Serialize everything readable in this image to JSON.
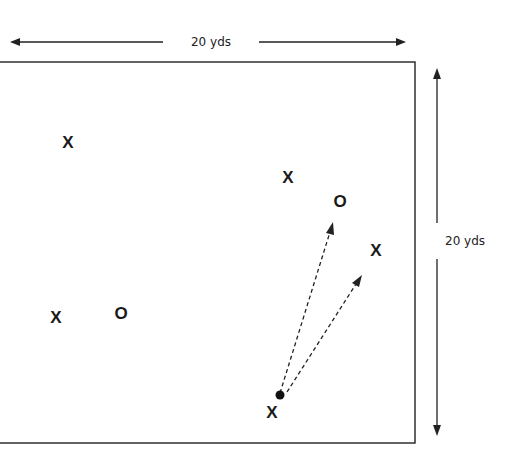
{
  "diagram": {
    "width_label": "20 yds",
    "height_label": "20 yds",
    "players": [
      {
        "symbol": "X",
        "x": 68,
        "y": 142
      },
      {
        "symbol": "X",
        "x": 288,
        "y": 177
      },
      {
        "symbol": "O",
        "x": 340,
        "y": 201
      },
      {
        "symbol": "X",
        "x": 376,
        "y": 250
      },
      {
        "symbol": "X",
        "x": 56,
        "y": 317
      },
      {
        "symbol": "O",
        "x": 121,
        "y": 313
      },
      {
        "symbol": "X",
        "x": 272,
        "y": 412
      }
    ],
    "ball": {
      "x": 280,
      "y": 395
    },
    "pass_arrows": [
      {
        "from": [
          280,
          393
        ],
        "to": [
          332,
          226
        ]
      },
      {
        "from": [
          287,
          393
        ],
        "to": [
          360,
          278
        ]
      }
    ]
  }
}
